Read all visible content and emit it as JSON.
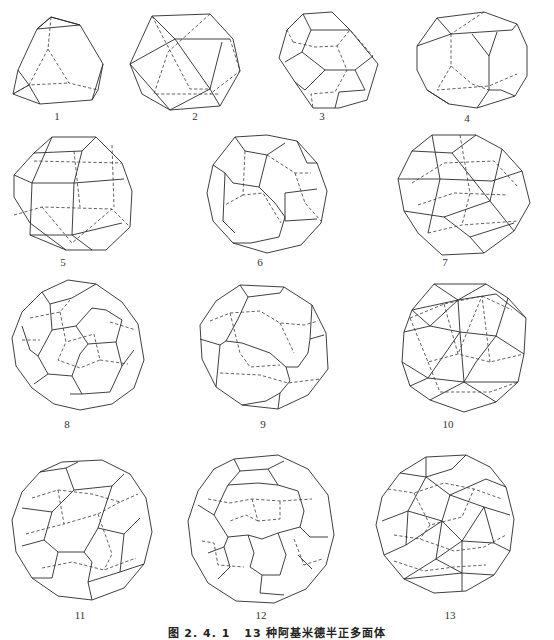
{
  "figure": {
    "caption_number": "图 2. 4. 1",
    "caption_text": "13 种阿基米德半正多面体",
    "items": [
      {
        "label": "1",
        "name": "truncated-tetrahedron"
      },
      {
        "label": "2",
        "name": "cuboctahedron"
      },
      {
        "label": "3",
        "name": "truncated-octahedron"
      },
      {
        "label": "4",
        "name": "truncated-cube"
      },
      {
        "label": "5",
        "name": "rhombicuboctahedron"
      },
      {
        "label": "6",
        "name": "truncated-cuboctahedron"
      },
      {
        "label": "7",
        "name": "icosidodecahedron"
      },
      {
        "label": "8",
        "name": "truncated-icosahedron"
      },
      {
        "label": "9",
        "name": "truncated-dodecahedron"
      },
      {
        "label": "10",
        "name": "snub-cube"
      },
      {
        "label": "11",
        "name": "rhombicosidodecahedron"
      },
      {
        "label": "12",
        "name": "truncated-icosidodecahedron"
      },
      {
        "label": "13",
        "name": "snub-dodecahedron"
      }
    ]
  }
}
